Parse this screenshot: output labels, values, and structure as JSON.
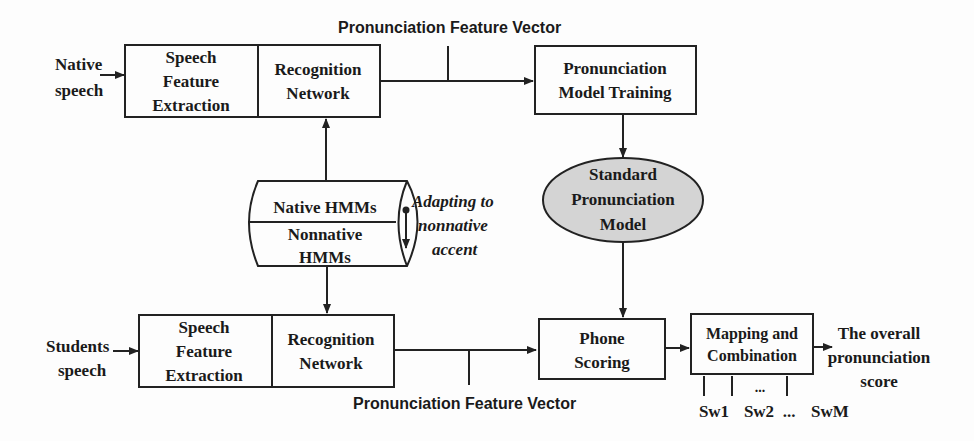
{
  "diagram": {
    "top_feature_label": "Pronunciation Feature Vector",
    "bottom_feature_label": "Pronunciation Feature Vector",
    "native_input": [
      "Native",
      "speech"
    ],
    "student_input": [
      "Students",
      "speech"
    ],
    "top_sfe": [
      "Speech",
      "Feature",
      "Extraction"
    ],
    "top_rn": [
      "Recognition",
      "Network"
    ],
    "bottom_sfe": [
      "Speech",
      "Feature",
      "Extraction"
    ],
    "bottom_rn": [
      "Recognition",
      "Network"
    ],
    "training": [
      "Pronunciation",
      "Model Training"
    ],
    "standard_model": [
      "Standard",
      "Pronunciation",
      "Model"
    ],
    "hmm_top": "Native HMMs",
    "hmm_bottom": [
      "Nonnative",
      "HMMs"
    ],
    "adapting": [
      "Adapting to",
      "nonnative",
      "accent"
    ],
    "phone_scoring": [
      "Phone",
      "Scoring"
    ],
    "mapping": [
      "Mapping and",
      "Combination"
    ],
    "output": [
      "The overall",
      "pronunciation",
      "score"
    ],
    "weights": [
      "Sw1",
      "Sw2",
      "...",
      "SwM"
    ],
    "weights_dots": "..."
  }
}
